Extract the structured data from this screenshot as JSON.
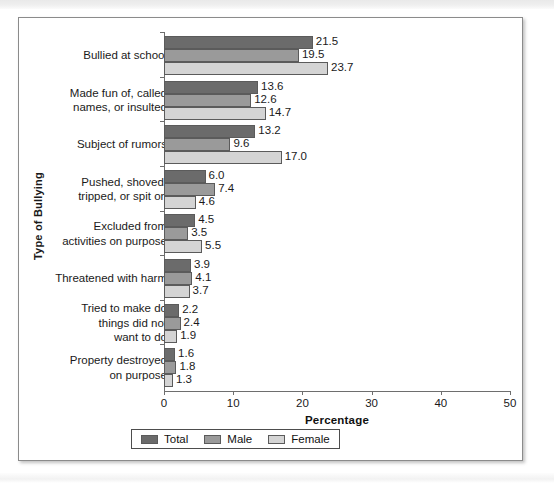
{
  "chart_data": {
    "type": "bar",
    "orientation": "horizontal",
    "title": "",
    "xlabel": "Percentage",
    "ylabel": "Type of Bullying",
    "xlim": [
      0,
      50
    ],
    "xticks": [
      0,
      10,
      20,
      30,
      40,
      50
    ],
    "grid": false,
    "legend_position": "bottom-center",
    "categories": [
      "Bullied at school",
      "Made fun of, called names, or insulted",
      "Subject of rumors",
      "Pushed, shoved, tripped, or spit on",
      "Excluded from activities on purpose",
      "Threatened with harm",
      "Tried to make do things did not want to do",
      "Property destroyed on purpose"
    ],
    "category_lines": [
      [
        "Bullied at school"
      ],
      [
        "Made fun of, called",
        "names, or insulted"
      ],
      [
        "Subject of rumors"
      ],
      [
        "Pushed, shoved,",
        "tripped, or spit on"
      ],
      [
        "Excluded from",
        "activities on purpose"
      ],
      [
        "Threatened with harm"
      ],
      [
        "Tried to make do",
        "things did not",
        "want to do"
      ],
      [
        "Property destroyed",
        "on purpose"
      ]
    ],
    "series": [
      {
        "name": "Total",
        "color": "#6b6b6b",
        "values": [
          21.5,
          13.6,
          13.2,
          6.0,
          4.5,
          3.9,
          2.2,
          1.6
        ]
      },
      {
        "name": "Male",
        "color": "#9a9a9a",
        "values": [
          19.5,
          12.6,
          9.6,
          7.4,
          3.5,
          4.1,
          2.4,
          1.8
        ]
      },
      {
        "name": "Female",
        "color": "#d4d4d4",
        "values": [
          23.7,
          14.7,
          17.0,
          4.6,
          5.5,
          3.7,
          1.9,
          1.3
        ]
      }
    ],
    "value_labels": [
      [
        "21.5",
        "19.5",
        "23.7"
      ],
      [
        "13.6",
        "12.6",
        "14.7"
      ],
      [
        "13.2",
        "9.6",
        "17.0"
      ],
      [
        "6.0",
        "7.4",
        "4.6"
      ],
      [
        "4.5",
        "3.5",
        "5.5"
      ],
      [
        "3.9",
        "4.1",
        "3.7"
      ],
      [
        "2.2",
        "2.4",
        "1.9"
      ],
      [
        "1.6",
        "1.8",
        "1.3"
      ]
    ],
    "tick_labels": [
      "0",
      "10",
      "20",
      "30",
      "40",
      "50"
    ],
    "legend": [
      {
        "label": "Total",
        "color": "#6b6b6b"
      },
      {
        "label": "Male",
        "color": "#9a9a9a"
      },
      {
        "label": "Female",
        "color": "#d4d4d4"
      }
    ]
  }
}
